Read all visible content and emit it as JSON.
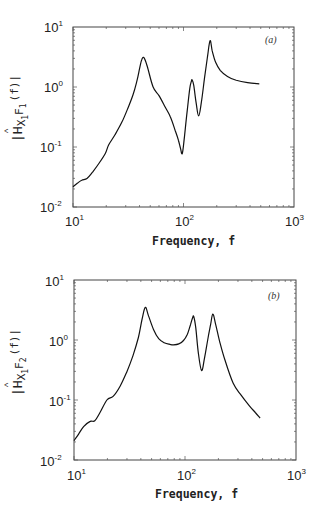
{
  "chart_data": [
    {
      "type": "line",
      "panel": "(a)",
      "title": "",
      "xlabel": "Frequency, f",
      "ylabel": "|Ĥ_{X1F1}(f)|",
      "ylabel_parts": {
        "main": "|H",
        "sub": "X",
        "sub2": "1",
        "sub3": "F",
        "sub4": "1",
        "tail": "(f)|"
      },
      "xscale": "log",
      "yscale": "log",
      "xlim": [
        10,
        1000
      ],
      "ylim": [
        0.01,
        10
      ],
      "xticks": [
        "10^1",
        "10^2",
        "10^3"
      ],
      "yticks": [
        "10^-2",
        "10^-1",
        "10^0",
        "10^1"
      ],
      "grid": false,
      "series": [
        {
          "name": "H_X1F1",
          "x": [
            10,
            11,
            12,
            13.4,
            15,
            17,
            19.6,
            21,
            24,
            27.7,
            31,
            35,
            38,
            40,
            42,
            44,
            47,
            53,
            60,
            68,
            76,
            84,
            90,
            94,
            97.5,
            102,
            108,
            114,
            118,
            120,
            124,
            130,
            137,
            145,
            155,
            165,
            174,
            182,
            195,
            215,
            250,
            300,
            380,
            485
          ],
          "y": [
            0.0217,
            0.025,
            0.028,
            0.03,
            0.038,
            0.052,
            0.078,
            0.108,
            0.16,
            0.26,
            0.42,
            0.75,
            1.3,
            2.0,
            2.9,
            3.05,
            2.2,
            1.01,
            0.72,
            0.47,
            0.32,
            0.19,
            0.13,
            0.095,
            0.078,
            0.15,
            0.4,
            0.95,
            1.25,
            1.31,
            1.05,
            0.55,
            0.33,
            0.55,
            1.4,
            3.2,
            5.9,
            4.0,
            2.6,
            1.9,
            1.5,
            1.3,
            1.18,
            1.13
          ]
        }
      ]
    },
    {
      "type": "line",
      "panel": "(b)",
      "title": "",
      "xlabel": "Frequency, f",
      "ylabel": "|Ĥ_{X1F2}(f)|",
      "xscale": "log",
      "yscale": "log",
      "xlim": [
        10,
        1000
      ],
      "ylim": [
        0.01,
        10
      ],
      "xticks": [
        "10^1",
        "10^2",
        "10^3"
      ],
      "yticks": [
        "10^-2",
        "10^-1",
        "10^0",
        "10^1"
      ],
      "grid": false,
      "series": [
        {
          "name": "H_X1F2",
          "x": [
            10,
            11,
            12.2,
            14,
            15.4,
            17,
            19.8,
            22.5,
            26,
            30,
            34,
            38,
            41,
            43.9,
            47,
            52,
            58,
            65,
            72,
            79,
            88,
            97,
            105,
            112,
            117,
            120,
            125,
            132,
            141,
            150,
            160,
            170,
            178,
            188,
            205,
            230,
            272,
            320,
            380,
            430,
            475
          ],
          "y": [
            0.021,
            0.027,
            0.036,
            0.044,
            0.045,
            0.06,
            0.1,
            0.115,
            0.17,
            0.3,
            0.55,
            1.1,
            2.2,
            3.5,
            2.5,
            1.5,
            1.05,
            0.9,
            0.85,
            0.83,
            0.86,
            0.98,
            1.25,
            1.8,
            2.35,
            2.45,
            1.6,
            0.6,
            0.31,
            0.5,
            1.0,
            1.8,
            2.7,
            1.9,
            0.95,
            0.45,
            0.19,
            0.12,
            0.08,
            0.062,
            0.05
          ]
        }
      ]
    }
  ],
  "panels": {
    "a": {
      "tag": "(a)",
      "xlabel": "Frequency, f",
      "ylabel_main": "|H",
      "ylabel_sub_a": "X",
      "ylabel_sub_a_idx": "1",
      "ylabel_sub_b": "F",
      "ylabel_sub_b_idx": "1",
      "ylabel_tail": "(f)|",
      "xticks": [
        {
          "base": "10",
          "exp": "1"
        },
        {
          "base": "10",
          "exp": "2"
        },
        {
          "base": "10",
          "exp": "3"
        }
      ],
      "yticks": [
        {
          "base": "10",
          "exp": "1"
        },
        {
          "base": "10",
          "exp": "0"
        },
        {
          "base": "10",
          "exp": "-1"
        },
        {
          "base": "10",
          "exp": "-2"
        }
      ]
    },
    "b": {
      "tag": "(b)",
      "xlabel": "Frequency, f",
      "ylabel_main": "|H",
      "ylabel_sub_a": "X",
      "ylabel_sub_a_idx": "1",
      "ylabel_sub_b": "F",
      "ylabel_sub_b_idx": "2",
      "ylabel_tail": "(f)|",
      "xticks": [
        {
          "base": "10",
          "exp": "1"
        },
        {
          "base": "10",
          "exp": "2"
        },
        {
          "base": "10",
          "exp": "3"
        }
      ],
      "yticks": [
        {
          "base": "10",
          "exp": "1"
        },
        {
          "base": "10",
          "exp": "0"
        },
        {
          "base": "10",
          "exp": "-1"
        },
        {
          "base": "10",
          "exp": "-2"
        }
      ]
    }
  }
}
